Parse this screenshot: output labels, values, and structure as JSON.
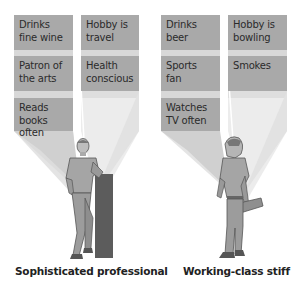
{
  "colors": {
    "box_fill": "#a9a9a9",
    "beam_light": "#e6e6e6",
    "beam_dark": "#d2d2d2",
    "text": "#2b2b2b"
  },
  "groups": [
    {
      "caption": "Sophisticated professional",
      "figure": "man-leaning-on-pillar-icon",
      "traits": [
        {
          "label": "Drinks fine wine",
          "lines": [
            "Drinks",
            "fine wine"
          ]
        },
        {
          "label": "Hobby is travel",
          "lines": [
            "Hobby is",
            "travel"
          ]
        },
        {
          "label": "Patron of the arts",
          "lines": [
            "Patron of",
            "the arts"
          ]
        },
        {
          "label": "Health conscious",
          "lines": [
            "Health",
            "conscious"
          ]
        },
        {
          "label": "Reads books often",
          "lines": [
            "Reads books",
            "often"
          ]
        }
      ]
    },
    {
      "caption": "Working-class stiff",
      "figure": "man-holding-lunchbox-icon",
      "traits": [
        {
          "label": "Drinks beer",
          "lines": [
            "Drinks",
            "beer"
          ]
        },
        {
          "label": "Hobby is bowling",
          "lines": [
            "Hobby is",
            "bowling"
          ]
        },
        {
          "label": "Sports fan",
          "lines": [
            "Sports",
            "fan"
          ]
        },
        {
          "label": "Smokes",
          "lines": [
            "Smokes"
          ]
        },
        {
          "label": "Watches TV often",
          "lines": [
            "Watches",
            "TV often"
          ]
        }
      ]
    }
  ]
}
